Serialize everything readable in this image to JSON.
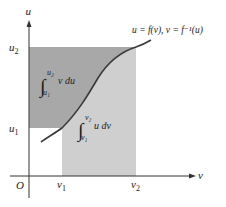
{
  "diagram": {
    "axes": {
      "vertical_label": "u",
      "horizontal_label": "v",
      "origin_label": "O"
    },
    "ticks": {
      "u1": "u",
      "u1_sub": "1",
      "u2": "u",
      "u2_sub": "2",
      "v1": "v",
      "v1_sub": "1",
      "v2": "v",
      "v2_sub": "2"
    },
    "curve_label": "u = f(v),  v = f⁻¹(u)",
    "integral_upper_region": {
      "lower": "u₁",
      "upper": "u₂",
      "integrand": "v  du"
    },
    "integral_lower_region": {
      "lower": "v₁",
      "upper": "v₂",
      "integrand": "u  dv"
    },
    "colors": {
      "dark_region": "#a8a8a8",
      "light_region": "#cfcfcf",
      "curve": "#3a3a3a",
      "axes": "#333333"
    }
  }
}
